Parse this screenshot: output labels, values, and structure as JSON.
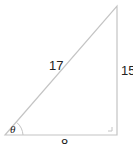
{
  "diagram": {
    "type": "right-triangle",
    "hypotenuse_label": "17",
    "opposite_label": "15",
    "adjacent_label": "8",
    "angle_label": "θ",
    "line_color": "#bfbfbf",
    "text_color": "#222222"
  }
}
